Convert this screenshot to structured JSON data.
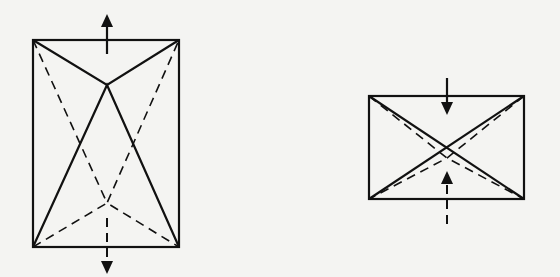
{
  "diagram": {
    "type": "geometric-folding-diagram",
    "colors": {
      "background": "#f4f4f2",
      "ink": "#111111"
    },
    "figures": [
      {
        "id": "left",
        "shape": "tall-rectangle",
        "rect": {
          "x1": 33,
          "y1": 40,
          "x2": 179,
          "y2": 247
        },
        "solid_apex": {
          "x": 107,
          "y": 85
        },
        "dashed_apex": {
          "x": 107,
          "y": 203
        },
        "arrows": [
          {
            "direction": "up",
            "line_style": "solid",
            "from": {
              "x": 107,
              "y": 52
            },
            "to": {
              "x": 107,
              "y": 15
            }
          },
          {
            "direction": "down",
            "line_style": "dashed",
            "from": {
              "x": 107,
              "y": 220
            },
            "to": {
              "x": 107,
              "y": 273
            }
          }
        ]
      },
      {
        "id": "right",
        "shape": "wide-rectangle",
        "rect": {
          "x1": 369,
          "y1": 96,
          "x2": 524,
          "y2": 199
        },
        "solid_cross": "diagonals",
        "dashed_apex": {
          "x": 447,
          "y": 158
        },
        "arrows": [
          {
            "direction": "down",
            "line_style": "solid",
            "from": {
              "x": 447,
              "y": 80
            },
            "to": {
              "x": 447,
              "y": 115
            }
          },
          {
            "direction": "up",
            "line_style": "dashed",
            "from": {
              "x": 447,
              "y": 222
            },
            "to": {
              "x": 447,
              "y": 172
            }
          }
        ]
      }
    ]
  }
}
